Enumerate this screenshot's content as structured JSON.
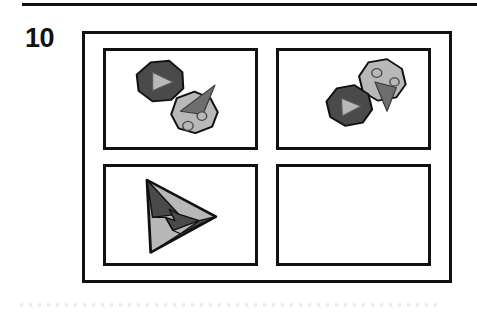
{
  "figure": {
    "number": "10",
    "rule_color": "#111111",
    "frame_color": "#111111",
    "background": "#ffffff"
  },
  "palette": {
    "dark_gray": "#4a4a4a",
    "mid_gray": "#6e6e6e",
    "light_gray": "#b8b8b8",
    "outline": "#111111",
    "white": "#ffffff"
  },
  "panels": [
    {
      "id": "panel-top-left",
      "position": "top-left",
      "empty": false,
      "shapes": [
        {
          "name": "dark-octagon-with-triangle",
          "type": "octagon",
          "fill": "dark_gray",
          "inner": "light-triangle-pointer"
        },
        {
          "name": "light-octagon-with-circles",
          "type": "octagon",
          "fill": "light_gray",
          "inner": "dark-spike-triangle",
          "circles": 2
        }
      ]
    },
    {
      "id": "panel-top-right",
      "position": "top-right",
      "empty": false,
      "shapes": [
        {
          "name": "light-octagon-with-circles",
          "type": "octagon",
          "fill": "light_gray",
          "inner": "dark-spike-triangle",
          "circles": 2
        },
        {
          "name": "dark-octagon-with-triangle",
          "type": "octagon",
          "fill": "dark_gray",
          "inner": "light-triangle-pointer"
        }
      ]
    },
    {
      "id": "panel-bottom-left",
      "position": "bottom-left",
      "empty": false,
      "shapes": [
        {
          "name": "large-arrow-triangle-composite",
          "type": "triangle-composite",
          "fill": "light_gray",
          "inner": "dark-chevron-wedges"
        }
      ]
    },
    {
      "id": "panel-bottom-right",
      "position": "bottom-right",
      "empty": true,
      "shapes": []
    }
  ]
}
